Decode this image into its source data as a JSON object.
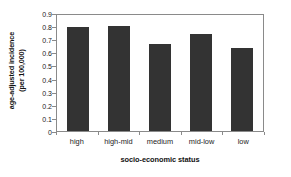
{
  "chart_data": {
    "type": "bar",
    "title": "",
    "subtitle": "",
    "categories": [
      "high",
      "high-mid",
      "medium",
      "mid-low",
      "low"
    ],
    "values": [
      0.79,
      0.8,
      0.66,
      0.74,
      0.63
    ],
    "xlabel": "socio-economic status",
    "ylabel_line1": "age-adjusted incidence",
    "ylabel_line2": "(per 100,000)",
    "ylabel": "age-adjusted incidence (per 100,000)",
    "ylim": [
      0,
      0.9
    ],
    "yticks": [
      "0.9",
      "0.8",
      "0.7",
      "0.6",
      "0.5",
      "0.4",
      "0.3",
      "0.2",
      "0.1",
      "0"
    ],
    "ytick_values": [
      0.9,
      0.8,
      0.7,
      0.6,
      0.5,
      0.4,
      0.3,
      0.2,
      0.1,
      0
    ],
    "grid": false,
    "legend": false,
    "legend_position": "none",
    "bar_color": "#333333",
    "axis_color": "#8a8a8a",
    "background_color": "#ffffff",
    "text_color": "#1a1a1a"
  }
}
